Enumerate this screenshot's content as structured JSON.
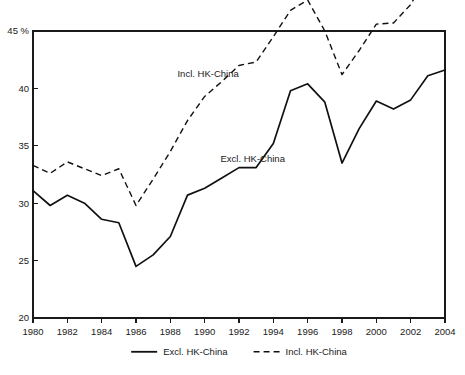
{
  "chart_data": {
    "type": "line",
    "title": "",
    "subtitle": "",
    "xlabel": "",
    "ylabel": "",
    "yunit": "%",
    "yaxis_top_label": "45 %",
    "x": [
      1980,
      1981,
      1982,
      1983,
      1984,
      1985,
      1986,
      1987,
      1988,
      1989,
      1990,
      1991,
      1992,
      1993,
      1994,
      1995,
      1996,
      1997,
      1998,
      1999,
      2000,
      2001,
      2002,
      2003,
      2004
    ],
    "xlim": [
      1980,
      2004
    ],
    "ylim": [
      20,
      45
    ],
    "yticks": [
      20,
      25,
      30,
      35,
      40,
      45
    ],
    "ytick_labels": [
      "20",
      "25",
      "30",
      "35",
      "40",
      "45 %"
    ],
    "xticks": [
      1980,
      1982,
      1984,
      1986,
      1988,
      1990,
      1992,
      1994,
      1996,
      1998,
      2000,
      2002,
      2004
    ],
    "xtick_labels": [
      "1980",
      "1982",
      "1984",
      "1986",
      "1988",
      "1990",
      "1992",
      "1994",
      "1996",
      "1998",
      "2000",
      "2002",
      "2004"
    ],
    "grid": false,
    "legend_position": "bottom-center",
    "series": [
      {
        "name": "Excl. HK-China",
        "style": "solid",
        "color": "#111111",
        "values": [
          31.1,
          29.8,
          30.7,
          30.0,
          28.6,
          28.3,
          24.5,
          25.5,
          27.1,
          30.7,
          31.3,
          32.2,
          33.1,
          33.1,
          35.2,
          39.8,
          40.4,
          38.8,
          33.5,
          36.5,
          38.9,
          38.2,
          39.0,
          41.1,
          41.6
        ]
      },
      {
        "name": "Incl. HK-China",
        "style": "dashed",
        "color": "#111111",
        "values": [
          33.3,
          32.6,
          33.6,
          33.0,
          32.4,
          33.0,
          29.8,
          32.1,
          34.5,
          37.2,
          39.3,
          40.6,
          42.0,
          42.3,
          44.5,
          46.8,
          47.7,
          45.0,
          41.2,
          43.3,
          45.6,
          45.7,
          47.3,
          50.0,
          50.6
        ]
      }
    ],
    "annotations": [
      {
        "text": "Incl. HK-China",
        "x": 1990.2,
        "y": 41.0
      },
      {
        "text": "Excl. HK-China",
        "x": 1992.8,
        "y": 33.6
      }
    ],
    "legend": [
      {
        "label": "Excl. HK-China",
        "style": "solid"
      },
      {
        "label": "Incl. HK-China",
        "style": "dashed"
      }
    ]
  }
}
